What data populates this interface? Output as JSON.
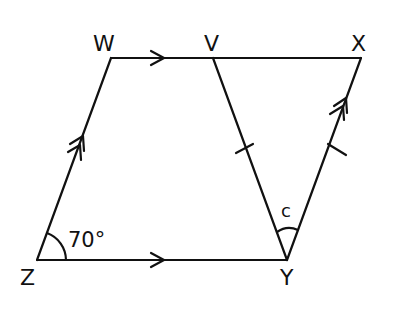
{
  "diagram": {
    "type": "geometry",
    "points": {
      "W": {
        "label": "W",
        "x": 111,
        "y": 58
      },
      "V": {
        "label": "V",
        "x": 213,
        "y": 58
      },
      "X": {
        "label": "X",
        "x": 361,
        "y": 58
      },
      "Z": {
        "label": "Z",
        "x": 37,
        "y": 260
      },
      "Y": {
        "label": "Y",
        "x": 287,
        "y": 260
      }
    },
    "segments": [
      "WX",
      "ZY",
      "ZW",
      "VY",
      "YX"
    ],
    "angles": {
      "Z": {
        "label": "70°"
      },
      "Y": {
        "label": "c"
      }
    },
    "markings": {
      "single_arrow": [
        "WX",
        "ZY"
      ],
      "double_arrow": [
        "ZW",
        "YX"
      ],
      "tick": [
        "VY",
        "YX"
      ]
    },
    "stroke_color": "#111111"
  }
}
